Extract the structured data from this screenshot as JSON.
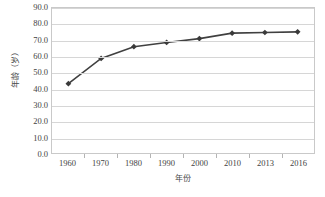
{
  "chart_data": {
    "type": "line",
    "title": "",
    "subtitle": "",
    "xlabel": "年份",
    "ylabel": "年龄（岁）",
    "categories": [
      "1960",
      "1970",
      "1980",
      "1990",
      "2000",
      "2010",
      "2013",
      "2016"
    ],
    "values": [
      43.0,
      58.7,
      66.0,
      68.6,
      71.0,
      74.4,
      74.8,
      75.2
    ],
    "series": [
      {
        "name": "年龄（岁）",
        "values": [
          43.0,
          58.7,
          66.0,
          68.6,
          71.0,
          74.4,
          74.8,
          75.2
        ]
      }
    ],
    "ylim": [
      0.0,
      90.0
    ],
    "ytick_step": 10.0,
    "ytick_labels": [
      "0.0",
      "10.0",
      "20.0",
      "30.0",
      "40.0",
      "50.0",
      "60.0",
      "70.0",
      "80.0",
      "90.0"
    ],
    "grid": "horizontal",
    "legend": "none",
    "line_color": "#404040",
    "marker": "diamond",
    "marker_color": "#3a3a3a",
    "plot_border_color": "#c9c9c9",
    "gridline_color": "#d6d6d6",
    "background": "#ffffff"
  }
}
